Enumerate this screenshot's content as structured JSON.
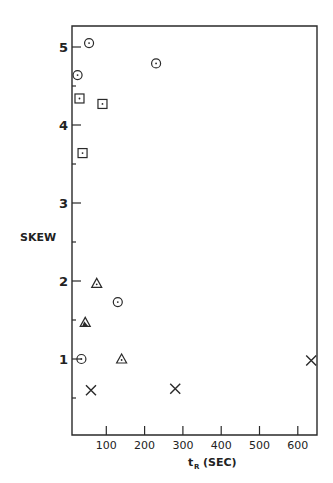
{
  "chart_data": {
    "type": "scatter",
    "title": "",
    "xlabel": "t_R (SEC)",
    "xlabel_main": "t",
    "xlabel_sub": "R",
    "xlabel_unit": "(SEC)",
    "ylabel": "SKEW",
    "xlim": [
      0,
      650
    ],
    "ylim": [
      0,
      5.3
    ],
    "grid": false,
    "legend": null,
    "x_ticks": [
      100,
      200,
      300,
      400,
      500,
      600
    ],
    "x_tick_labels": [
      "100",
      "200",
      "300",
      "400",
      "500",
      "600"
    ],
    "y_ticks_major": [
      1,
      2,
      3,
      4,
      5
    ],
    "y_tick_labels": [
      "1",
      "2",
      "3",
      "4",
      "5"
    ],
    "y_ticks_minor": [
      0.5,
      1.5,
      2.5,
      3.5,
      4.5
    ],
    "series": [
      {
        "name": "circle-dot",
        "marker": "circle-dot",
        "points": [
          {
            "x": 55,
            "y": 5.05
          },
          {
            "x": 25,
            "y": 4.64
          },
          {
            "x": 230,
            "y": 4.79
          },
          {
            "x": 130,
            "y": 1.73
          },
          {
            "x": 35,
            "y": 1.0
          }
        ]
      },
      {
        "name": "square-dot",
        "marker": "square-dot",
        "points": [
          {
            "x": 30,
            "y": 4.34
          },
          {
            "x": 90,
            "y": 4.27
          },
          {
            "x": 38,
            "y": 3.64
          }
        ]
      },
      {
        "name": "triangle",
        "marker": "triangle-dot",
        "points": [
          {
            "x": 75,
            "y": 1.97
          },
          {
            "x": 140,
            "y": 1.0
          }
        ]
      },
      {
        "name": "triangle-filled",
        "marker": "triangle-filled",
        "points": [
          {
            "x": 45,
            "y": 1.47
          }
        ]
      },
      {
        "name": "cross",
        "marker": "x",
        "points": [
          {
            "x": 60,
            "y": 0.6
          },
          {
            "x": 280,
            "y": 0.62
          },
          {
            "x": 635,
            "y": 0.98
          }
        ]
      }
    ]
  }
}
